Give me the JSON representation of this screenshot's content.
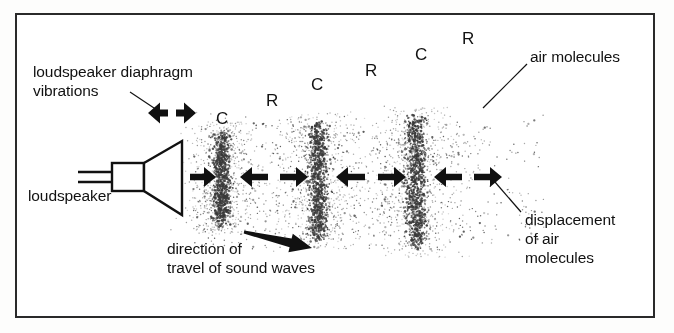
{
  "figure": {
    "kind": "physics-diagram",
    "background_color": "#ffffff",
    "ink_color": "#111111",
    "border_color": "#2a2a2a"
  },
  "labels": {
    "diaphragm_line1": "loudspeaker diaphragm",
    "diaphragm_line2": "vibrations",
    "loudspeaker": "loudspeaker",
    "direction_line1": "direction of",
    "direction_line2": "travel of sound waves",
    "air_molecules": "air molecules",
    "displacement_line1": "displacement",
    "displacement_line2": "of air",
    "displacement_line3": "molecules"
  },
  "wave_markers": [
    {
      "text": "C",
      "x": 216,
      "y": 110,
      "meaning": "compression"
    },
    {
      "text": "R",
      "x": 266,
      "y": 92,
      "meaning": "rarefaction"
    },
    {
      "text": "C",
      "x": 311,
      "y": 76,
      "meaning": "compression"
    },
    {
      "text": "R",
      "x": 365,
      "y": 62,
      "meaning": "rarefaction"
    },
    {
      "text": "C",
      "x": 415,
      "y": 46,
      "meaning": "compression"
    },
    {
      "text": "R",
      "x": 462,
      "y": 30,
      "meaning": "rarefaction"
    }
  ],
  "chart_data": {
    "type": "scatter",
    "xlabel": "distance from loudspeaker",
    "ylabel": "",
    "grid": false,
    "legend": "none",
    "field_bounds": {
      "x_min": 193,
      "x_max": 545,
      "y_min": 118,
      "y_max": 248
    },
    "compression_bands": [
      {
        "label": "C",
        "center_x": 222,
        "half_width": 7,
        "y_top": 128,
        "y_bottom": 228,
        "density": 1.0
      },
      {
        "label": "C",
        "center_x": 318,
        "half_width": 8,
        "y_top": 118,
        "y_bottom": 243,
        "density": 1.05
      },
      {
        "label": "C",
        "center_x": 416,
        "half_width": 9,
        "y_top": 112,
        "y_bottom": 252,
        "density": 1.1
      }
    ],
    "rarefaction_centers": [
      270,
      367,
      468
    ],
    "background_particle_count": 2100,
    "band_particle_count": 900
  },
  "speaker": {
    "wire_y_top": 172,
    "wire_y_bottom": 182,
    "wire_x_start": 78,
    "body": {
      "x": 112,
      "y": 163,
      "w": 32,
      "h": 28
    },
    "cone": {
      "x_back": 144,
      "y_back_top": 163,
      "y_back_bottom": 191,
      "x_front": 182,
      "y_front_top": 141,
      "y_front_bottom": 215
    }
  },
  "arrows": {
    "diaphragm_pair": {
      "y": 113,
      "left_tip": 148,
      "right_tip": 196,
      "gap_center": 172
    },
    "propagation_row_y": 177,
    "propagation": [
      {
        "dir": "right",
        "x1": 190,
        "x2": 216
      },
      {
        "dir": "left",
        "x1": 268,
        "x2": 240
      },
      {
        "dir": "right",
        "x1": 280,
        "x2": 308
      },
      {
        "dir": "left",
        "x1": 365,
        "x2": 336
      },
      {
        "dir": "right",
        "x1": 378,
        "x2": 406
      },
      {
        "dir": "left",
        "x1": 462,
        "x2": 434
      },
      {
        "dir": "right",
        "x1": 474,
        "x2": 502
      }
    ],
    "travel_arrow": {
      "x1": 244,
      "y1": 232,
      "x2": 312,
      "y2": 248
    }
  },
  "leaders": [
    {
      "name": "diaphragm-leader",
      "x1": 130,
      "y1": 92,
      "x2": 157,
      "y2": 110
    },
    {
      "name": "air-molecules-leader",
      "x1": 527,
      "y1": 64,
      "x2": 483,
      "y2": 108
    },
    {
      "name": "displacement-leader",
      "x1": 521,
      "y1": 212,
      "x2": 495,
      "y2": 182
    }
  ],
  "label_positions": {
    "diaphragm": {
      "x": 33,
      "y": 62
    },
    "loudspeaker": {
      "x": 28,
      "y": 186
    },
    "direction": {
      "x": 167,
      "y": 239
    },
    "air_molecules": {
      "x": 530,
      "y": 47
    },
    "displacement": {
      "x": 525,
      "y": 210
    }
  }
}
